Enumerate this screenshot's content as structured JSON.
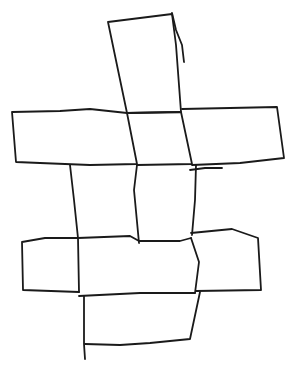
{
  "diagram": {
    "stroke_color": "#1a1a1a",
    "background": "#ffffff",
    "shapes": [
      {
        "name": "top-column-box",
        "points": "108,22 140,18 172,14 176,45 181,112 127,113 118,70 108,22"
      },
      {
        "name": "extra-stroke-top",
        "points": "172,13 176,30 182,45 184,62"
      },
      {
        "name": "upper-band-left-box",
        "points": "12,112 60,111 90,109 127,113 137,164 90,165 40,163 16,162 12,112"
      },
      {
        "name": "upper-band-center-box",
        "points": "127,113 181,112 192,164 137,165"
      },
      {
        "name": "upper-band-right-box",
        "points": "182,109 230,108 277,107 284,158 240,163 192,165"
      },
      {
        "name": "tick-mark",
        "points": "190,170 205,168 222,168"
      },
      {
        "name": "middle-col-left-line",
        "points": "70,165 74,200 78,238"
      },
      {
        "name": "middle-col-center-line",
        "points": "137,165 134,190 139,243"
      },
      {
        "name": "middle-col-right-line",
        "points": "196,165 195,200 192,235"
      },
      {
        "name": "lower-band-left-box",
        "points": "78,238 45,238 22,242 23,290 79,292"
      },
      {
        "name": "lower-band-center-top",
        "points": "78,238 130,236 139,241 180,241 191,238"
      },
      {
        "name": "lower-band-center-right",
        "points": "191,238 199,262 195,293"
      },
      {
        "name": "lower-band-center-left",
        "points": "78,238 79,292"
      },
      {
        "name": "lower-band-right-box",
        "points": "191,233 232,229 258,238 261,290 196,291"
      },
      {
        "name": "lower-band-bottom",
        "points": "79,296 140,293 195,293"
      },
      {
        "name": "bottom-box",
        "points": "84,296 84,344 85,359 M85,344 120,345 150,343 190,339 200,292"
      }
    ]
  }
}
